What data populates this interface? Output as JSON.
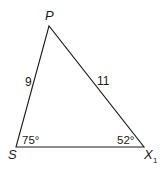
{
  "diagram": {
    "type": "triangle",
    "vertices": [
      {
        "id": "P",
        "label": "P",
        "subscript": ""
      },
      {
        "id": "S",
        "label": "S",
        "subscript": ""
      },
      {
        "id": "X1",
        "label": "X",
        "subscript": "1"
      }
    ],
    "sides": [
      {
        "id": "PS",
        "label": "9"
      },
      {
        "id": "PX1",
        "label": "11"
      },
      {
        "id": "SX1",
        "label": ""
      }
    ],
    "angles": [
      {
        "vertex": "S",
        "label": "75°"
      },
      {
        "vertex": "X1",
        "label": "52°"
      }
    ],
    "colors": {
      "stroke": "#1a1a1a",
      "background": "#ffffff"
    }
  }
}
